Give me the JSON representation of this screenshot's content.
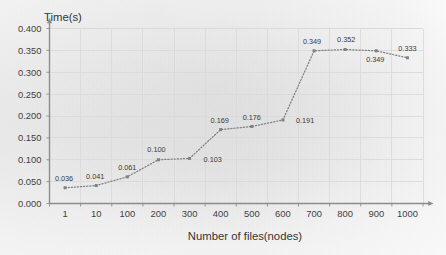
{
  "chart_data": {
    "type": "line",
    "title": "",
    "xlabel": "Number of files(nodes)",
    "ylabel": "Time(s)",
    "categories": [
      "1",
      "10",
      "100",
      "200",
      "300",
      "400",
      "500",
      "600",
      "700",
      "800",
      "900",
      "1000"
    ],
    "values": [
      0.036,
      0.041,
      0.061,
      0.1,
      0.103,
      0.169,
      0.176,
      0.191,
      0.349,
      0.352,
      0.349,
      0.333
    ],
    "data_labels": [
      "0.036",
      "0.041",
      "0.061",
      "0.100",
      "0.103",
      "0.169",
      "0.176",
      "0.191",
      "0.349",
      "0.352",
      "0.349",
      "0.333"
    ],
    "ylim": [
      0.0,
      0.4
    ],
    "ytick_labels": [
      "0.400",
      "0.350",
      "0.300",
      "0.250",
      "0.200",
      "0.150",
      "0.100",
      "0.050",
      "0.000"
    ],
    "ytick_values": [
      0.4,
      0.35,
      0.3,
      0.25,
      0.2,
      0.15,
      0.1,
      0.05,
      0.0
    ],
    "xtick_labels": [
      "1",
      "10",
      "100",
      "200",
      "300",
      "400",
      "500",
      "600",
      "700",
      "800",
      "900",
      "1000"
    ],
    "grid": true,
    "legend": "none",
    "line_style": "dotted",
    "marker": "square",
    "series_color": "#808080",
    "grid_color": "#d9d9d9",
    "axis_color": "#8c8c8c",
    "text_color": "#3f3f3f"
  },
  "axis_titles": {
    "y": "Time(s)",
    "x": "Number of files(nodes)"
  }
}
